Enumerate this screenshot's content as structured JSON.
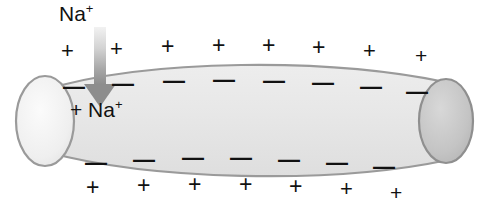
{
  "figure": {
    "background_color": "#ffffff"
  },
  "labels": {
    "extracellular_ion": "Na",
    "extracellular_ion_charge": "+",
    "intracellular_plus": "+",
    "intracellular_ion": "Na",
    "intracellular_ion_charge": "+"
  },
  "arrow": {
    "name": "sodium-influx-arrow",
    "direction": "down",
    "color_top": "#f0f0f0",
    "color_bottom": "#8d8d8d"
  },
  "axon": {
    "body_fill": "#e6e6e6",
    "outline": "#9a9a9a",
    "left_cap_fill": "#f0f0f0",
    "right_cap_fill": "#c2c2c2"
  },
  "charges": {
    "plus_symbol": "+",
    "minus_symbol": "—",
    "top_outer_plus": [
      {
        "x": 61,
        "y": 40,
        "size": 22
      },
      {
        "x": 110,
        "y": 38,
        "size": 22
      },
      {
        "x": 161,
        "y": 35,
        "size": 23
      },
      {
        "x": 212,
        "y": 34,
        "size": 23
      },
      {
        "x": 262,
        "y": 34,
        "size": 23
      },
      {
        "x": 312,
        "y": 36,
        "size": 23
      },
      {
        "x": 363,
        "y": 40,
        "size": 22
      },
      {
        "x": 415,
        "y": 45,
        "size": 21
      }
    ],
    "top_inner_minus": [
      {
        "x": 63,
        "y": 76,
        "size": 22
      },
      {
        "x": 112,
        "y": 73,
        "size": 22
      },
      {
        "x": 163,
        "y": 70,
        "size": 22
      },
      {
        "x": 213,
        "y": 69,
        "size": 22
      },
      {
        "x": 263,
        "y": 70,
        "size": 22
      },
      {
        "x": 312,
        "y": 72,
        "size": 22
      },
      {
        "x": 360,
        "y": 76,
        "size": 22
      },
      {
        "x": 406,
        "y": 81,
        "size": 22
      }
    ],
    "bottom_inner_minus": [
      {
        "x": 85,
        "y": 152,
        "size": 22
      },
      {
        "x": 133,
        "y": 149,
        "size": 22
      },
      {
        "x": 182,
        "y": 147,
        "size": 22
      },
      {
        "x": 230,
        "y": 147,
        "size": 22
      },
      {
        "x": 278,
        "y": 149,
        "size": 22
      },
      {
        "x": 326,
        "y": 152,
        "size": 22
      },
      {
        "x": 373,
        "y": 156,
        "size": 22
      }
    ],
    "bottom_outer_plus": [
      {
        "x": 86,
        "y": 176,
        "size": 23
      },
      {
        "x": 137,
        "y": 174,
        "size": 23
      },
      {
        "x": 188,
        "y": 173,
        "size": 23
      },
      {
        "x": 239,
        "y": 173,
        "size": 23
      },
      {
        "x": 289,
        "y": 175,
        "size": 23
      },
      {
        "x": 340,
        "y": 178,
        "size": 22
      },
      {
        "x": 390,
        "y": 182,
        "size": 21
      }
    ]
  }
}
